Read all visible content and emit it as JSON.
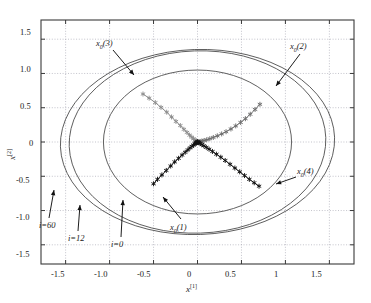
{
  "figure": {
    "background": "#ffffff",
    "frame_color": "#3a3a3a",
    "grid_color": "#9a9aa8"
  },
  "axes": {
    "xlabel": "x",
    "xlabel_sup": "[1]",
    "ylabel": "x",
    "ylabel_sup": "[2]",
    "xticks": [
      "-1.5",
      "-1.0",
      "-0.5",
      "0",
      "0.5",
      "1",
      "1.5"
    ],
    "yticks": [
      "1.5",
      "1.0",
      "0.5",
      "0",
      "-0.5",
      "-1.0",
      "-1.5"
    ],
    "xlim": [
      -1.78,
      1.78
    ],
    "ylim": [
      -1.78,
      1.78
    ]
  },
  "annotations": {
    "x0_3": {
      "base": "x",
      "sub": "0",
      "arg": "(3)"
    },
    "x0_2": {
      "base": "x",
      "sub": "0",
      "arg": "(2)"
    },
    "x0_4": {
      "base": "x",
      "sub": "0",
      "arg": "(4)"
    },
    "x0_1": {
      "base": "x",
      "sub": "0",
      "arg": "(1)"
    },
    "i60": {
      "text": "i=60"
    },
    "i12": {
      "text": "i=12"
    },
    "i0": {
      "text": "i=0"
    }
  },
  "chart_data": {
    "type": "line",
    "title": "",
    "xlabel": "x^[1]",
    "ylabel": "x^[2]",
    "xlim": [
      -1.78,
      1.78
    ],
    "ylim": [
      -1.78,
      1.78
    ],
    "grid": true,
    "legend": "none",
    "ellipses": [
      {
        "name": "i=0",
        "rx": 1.07,
        "ry": 1.05,
        "rotation_deg": 0,
        "color": "#444444"
      },
      {
        "name": "i=12",
        "rx": 1.46,
        "ry": 1.33,
        "rotation_deg": -2.0,
        "color": "#444444"
      },
      {
        "name": "i=60",
        "rx": 1.56,
        "ry": 1.35,
        "rotation_deg": -2.0,
        "color": "#444444"
      }
    ],
    "series": [
      {
        "name": "x0(3)",
        "color": "#8c8c8c",
        "marker": "asterisk",
        "start": [
          -0.62,
          0.7
        ],
        "end": [
          0.0,
          0.0
        ],
        "points": [
          [
            -0.62,
            0.7
          ],
          [
            -0.55,
            0.64
          ],
          [
            -0.48,
            0.575
          ],
          [
            -0.415,
            0.505
          ],
          [
            -0.35,
            0.435
          ],
          [
            -0.295,
            0.365
          ],
          [
            -0.245,
            0.3
          ],
          [
            -0.195,
            0.24
          ],
          [
            -0.155,
            0.185
          ],
          [
            -0.12,
            0.14
          ],
          [
            -0.09,
            0.1
          ],
          [
            -0.065,
            0.07
          ],
          [
            -0.045,
            0.046
          ],
          [
            -0.03,
            0.029
          ],
          [
            -0.018,
            0.017
          ],
          [
            -0.01,
            0.009
          ],
          [
            -0.005,
            0.004
          ],
          [
            0.0,
            0.0
          ]
        ]
      },
      {
        "name": "x0(2)",
        "color": "#6e6e6e",
        "marker": "asterisk",
        "start": [
          0.71,
          0.55
        ],
        "end": [
          0.0,
          0.0
        ],
        "points": [
          [
            0.71,
            0.55
          ],
          [
            0.655,
            0.475
          ],
          [
            0.6,
            0.405
          ],
          [
            0.545,
            0.34
          ],
          [
            0.49,
            0.285
          ],
          [
            0.435,
            0.235
          ],
          [
            0.38,
            0.19
          ],
          [
            0.325,
            0.15
          ],
          [
            0.275,
            0.118
          ],
          [
            0.225,
            0.09
          ],
          [
            0.18,
            0.066
          ],
          [
            0.14,
            0.048
          ],
          [
            0.105,
            0.033
          ],
          [
            0.075,
            0.022
          ],
          [
            0.05,
            0.014
          ],
          [
            0.03,
            0.008
          ],
          [
            0.015,
            0.004
          ],
          [
            0.0,
            0.0
          ]
        ]
      },
      {
        "name": "x0(1)",
        "color": "#111111",
        "marker": "asterisk",
        "start": [
          -0.5,
          -0.61
        ],
        "end": [
          0.0,
          0.0
        ],
        "points": [
          [
            -0.5,
            -0.61
          ],
          [
            -0.455,
            -0.545
          ],
          [
            -0.405,
            -0.48
          ],
          [
            -0.355,
            -0.415
          ],
          [
            -0.305,
            -0.35
          ],
          [
            -0.26,
            -0.29
          ],
          [
            -0.215,
            -0.238
          ],
          [
            -0.175,
            -0.19
          ],
          [
            -0.14,
            -0.15
          ],
          [
            -0.11,
            -0.115
          ],
          [
            -0.085,
            -0.086
          ],
          [
            -0.063,
            -0.063
          ],
          [
            -0.045,
            -0.044
          ],
          [
            -0.031,
            -0.029
          ],
          [
            -0.02,
            -0.018
          ],
          [
            -0.012,
            -0.01
          ],
          [
            -0.006,
            -0.005
          ],
          [
            0.0,
            0.0
          ]
        ]
      },
      {
        "name": "x0(4)",
        "color": "#111111",
        "marker": "asterisk",
        "start": [
          0.7,
          -0.645
        ],
        "end": [
          0.0,
          0.0
        ],
        "points": [
          [
            0.7,
            -0.645
          ],
          [
            0.645,
            -0.595
          ],
          [
            0.59,
            -0.545
          ],
          [
            0.535,
            -0.49
          ],
          [
            0.48,
            -0.435
          ],
          [
            0.425,
            -0.38
          ],
          [
            0.37,
            -0.325
          ],
          [
            0.315,
            -0.27
          ],
          [
            0.265,
            -0.222
          ],
          [
            0.215,
            -0.178
          ],
          [
            0.17,
            -0.138
          ],
          [
            0.132,
            -0.105
          ],
          [
            0.1,
            -0.078
          ],
          [
            0.072,
            -0.055
          ],
          [
            0.05,
            -0.037
          ],
          [
            0.032,
            -0.023
          ],
          [
            0.018,
            -0.012
          ],
          [
            0.008,
            -0.005
          ],
          [
            0.0,
            0.0
          ]
        ]
      }
    ]
  }
}
